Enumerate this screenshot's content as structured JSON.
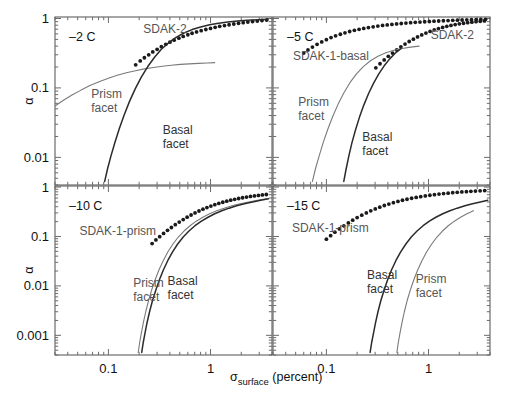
{
  "figure": {
    "width": 510,
    "height": 401,
    "background": "#ffffff",
    "frame_color": "#6b6b6b",
    "dark_curve_color": "#2b2b2b",
    "light_curve_color": "#7a7a7a",
    "dot_color": "#1a1a1a",
    "text_color": "#111111",
    "label_gray": "#555555"
  },
  "axis": {
    "xlabel_sigma": "σ",
    "xlabel_sub": "surface",
    "xlabel_unit": " (percent)",
    "xlabel_full": "σsurface (percent)",
    "ylabel": "α",
    "xscale": "log",
    "yscale": "log",
    "xlim": [
      0.03,
      4.0
    ],
    "x_ticklabels": [
      "0.1",
      "1"
    ],
    "x_tickvalues": [
      0.1,
      1
    ],
    "y_ticklabels_top": [
      "1",
      "0.1",
      "0.01"
    ],
    "y_tickvalues_top": [
      1,
      0.1,
      0.01
    ],
    "y_ticklabels_bottom": [
      "1",
      "0.1",
      "0.01",
      "0.001"
    ],
    "y_tickvalues_bottom": [
      1,
      0.1,
      0.01,
      0.001
    ],
    "ylim_top": [
      0.004,
      1.05
    ],
    "ylim_bottom": [
      0.0004,
      1.05
    ]
  },
  "chart_data": {
    "type": "line",
    "title": "",
    "xlabel": "σsurface (percent)",
    "ylabel": "α",
    "xscale": "log",
    "yscale": "log",
    "grid": false,
    "legend_position": "inline-annotations",
    "panels": [
      {
        "id": "panel-top-left",
        "temperature_label": "–2 C",
        "xlim": [
          0.03,
          4.0
        ],
        "ylim": [
          0.004,
          1.05
        ],
        "ytick_labels": [
          "1",
          "0.1",
          "0.01"
        ],
        "series": [
          {
            "name": "SDAK-2",
            "style": "dots",
            "label": "SDAK-2",
            "label_x": 0.22,
            "label_y": 0.62,
            "x": [
              0.185,
              0.205,
              0.225,
              0.248,
              0.272,
              0.3,
              0.33,
              0.365,
              0.4,
              0.44,
              0.49,
              0.54,
              0.6,
              0.66,
              0.73,
              0.81,
              0.9,
              1.0,
              1.11,
              1.23,
              1.37,
              1.52,
              1.69,
              1.88,
              2.09,
              2.32,
              2.58,
              2.87,
              3.19,
              3.55
            ],
            "y": [
              0.215,
              0.245,
              0.272,
              0.3,
              0.33,
              0.36,
              0.392,
              0.424,
              0.455,
              0.487,
              0.52,
              0.552,
              0.583,
              0.613,
              0.64,
              0.667,
              0.694,
              0.72,
              0.745,
              0.77,
              0.79,
              0.812,
              0.833,
              0.853,
              0.87,
              0.888,
              0.905,
              0.92,
              0.935,
              0.948
            ]
          },
          {
            "name": "Prism facet",
            "style": "line-light",
            "label_line1": "Prism",
            "label_line2": "facet",
            "label_x": 0.068,
            "label_y": 0.072,
            "x": [
              0.03,
              0.036,
              0.044,
              0.054,
              0.066,
              0.081,
              0.1,
              0.122,
              0.15,
              0.184,
              0.225,
              0.276,
              0.338,
              0.414,
              0.507,
              0.62,
              0.76,
              0.93,
              1.1
            ],
            "y": [
              0.055,
              0.066,
              0.079,
              0.093,
              0.108,
              0.123,
              0.138,
              0.152,
              0.165,
              0.177,
              0.188,
              0.197,
              0.205,
              0.212,
              0.218,
              0.222,
              0.226,
              0.229,
              0.231
            ]
          },
          {
            "name": "Basal facet",
            "style": "line-dark",
            "label_line1": "Basal",
            "label_line2": "facet",
            "label_x": 0.34,
            "label_y": 0.022,
            "x": [
              0.092,
              0.098,
              0.106,
              0.116,
              0.128,
              0.143,
              0.161,
              0.183,
              0.21,
              0.243,
              0.283,
              0.33,
              0.39,
              0.46,
              0.55,
              0.66,
              0.8,
              0.98,
              1.2,
              1.48,
              1.84,
              2.3,
              2.9,
              3.65
            ],
            "y": [
              0.0045,
              0.0068,
              0.0105,
              0.0165,
              0.026,
              0.041,
              0.064,
              0.097,
              0.143,
              0.203,
              0.277,
              0.36,
              0.448,
              0.535,
              0.618,
              0.692,
              0.756,
              0.81,
              0.855,
              0.891,
              0.919,
              0.941,
              0.958,
              0.971
            ]
          }
        ]
      },
      {
        "id": "panel-top-right",
        "temperature_label": "–5 C",
        "xlim": [
          0.03,
          4.0
        ],
        "ylim": [
          0.004,
          1.05
        ],
        "series": [
          {
            "name": "SDAK-1-basal",
            "style": "dots",
            "label": "SDAK-1-basal",
            "label_x": 0.047,
            "label_y": 0.255,
            "x": [
              0.06,
              0.066,
              0.073,
              0.081,
              0.09,
              0.1,
              0.111,
              0.123,
              0.137,
              0.152,
              0.169,
              0.188,
              0.209,
              0.232,
              0.258,
              0.287,
              0.319,
              0.355,
              0.394,
              0.438,
              0.487,
              0.541,
              0.601,
              0.668,
              0.742,
              0.825,
              0.917,
              1.019,
              1.132,
              1.258,
              1.398,
              1.554,
              1.727,
              1.919,
              2.133,
              2.37,
              2.634,
              2.927,
              3.253,
              3.615
            ],
            "y": [
              0.318,
              0.352,
              0.388,
              0.424,
              0.46,
              0.495,
              0.53,
              0.562,
              0.593,
              0.622,
              0.649,
              0.674,
              0.698,
              0.72,
              0.74,
              0.759,
              0.777,
              0.793,
              0.808,
              0.822,
              0.835,
              0.847,
              0.858,
              0.869,
              0.879,
              0.888,
              0.897,
              0.905,
              0.913,
              0.92,
              0.927,
              0.933,
              0.939,
              0.945,
              0.95,
              0.955,
              0.96,
              0.964,
              0.968,
              0.972
            ]
          },
          {
            "name": "SDAK-2",
            "style": "dots",
            "label": "SDAK-2",
            "label_x": 1.05,
            "label_y": 0.5,
            "x": [
              0.305,
              0.335,
              0.368,
              0.404,
              0.444,
              0.488,
              0.536,
              0.589,
              0.647,
              0.711,
              0.781,
              0.858,
              0.943,
              1.036,
              1.138,
              1.251,
              1.374,
              1.51,
              1.659,
              1.823,
              2.003,
              2.201,
              2.419,
              2.658,
              2.92,
              3.209,
              3.526
            ],
            "y": [
              0.195,
              0.223,
              0.253,
              0.285,
              0.318,
              0.353,
              0.39,
              0.428,
              0.466,
              0.504,
              0.542,
              0.58,
              0.616,
              0.651,
              0.684,
              0.715,
              0.744,
              0.77,
              0.794,
              0.816,
              0.836,
              0.854,
              0.87,
              0.885,
              0.898,
              0.91,
              0.921
            ]
          },
          {
            "name": "Prism facet",
            "style": "line-light",
            "label_line1": "Prism",
            "label_line2": "facet",
            "label_x": 0.053,
            "label_y": 0.055,
            "x": [
              0.073,
              0.078,
              0.085,
              0.093,
              0.103,
              0.115,
              0.13,
              0.148,
              0.17,
              0.197,
              0.23,
              0.27,
              0.32,
              0.382,
              0.458,
              0.552,
              0.668,
              0.81
            ],
            "y": [
              0.0045,
              0.0068,
              0.0105,
              0.0163,
              0.0252,
              0.0385,
              0.058,
              0.0845,
              0.119,
              0.159,
              0.203,
              0.246,
              0.286,
              0.32,
              0.348,
              0.37,
              0.387,
              0.4
            ]
          },
          {
            "name": "Basal facet",
            "style": "line-dark",
            "label_line1": "Basal",
            "label_line2": "facet",
            "label_x": 0.225,
            "label_y": 0.017,
            "x": [
              0.148,
              0.156,
              0.166,
              0.178,
              0.193,
              0.211,
              0.233,
              0.259,
              0.29,
              0.326,
              0.368,
              0.417,
              0.474,
              0.54
            ],
            "y": [
              0.0045,
              0.0068,
              0.0105,
              0.0163,
              0.025,
              0.038,
              0.057,
              0.083,
              0.117,
              0.159,
              0.208,
              0.262,
              0.318,
              0.372
            ]
          }
        ]
      },
      {
        "id": "panel-bottom-left",
        "temperature_label": "–10 C",
        "xlim": [
          0.03,
          4.0
        ],
        "ylim": [
          0.0004,
          1.05
        ],
        "ytick_labels": [
          "1",
          "0.1",
          "0.01",
          "0.001"
        ],
        "series": [
          {
            "name": "SDAK-1-prism",
            "style": "dots",
            "label": "SDAK-1-prism",
            "label_x": 0.052,
            "label_y": 0.105,
            "x": [
              0.268,
              0.292,
              0.318,
              0.347,
              0.379,
              0.414,
              0.452,
              0.494,
              0.54,
              0.59,
              0.645,
              0.705,
              0.771,
              0.843,
              0.922,
              1.008,
              1.102,
              1.205,
              1.318,
              1.441,
              1.576,
              1.723,
              1.884,
              2.06,
              2.253,
              2.463,
              2.693,
              2.945,
              3.22,
              3.52
            ],
            "y": [
              0.072,
              0.085,
              0.099,
              0.115,
              0.133,
              0.152,
              0.173,
              0.196,
              0.22,
              0.246,
              0.272,
              0.3,
              0.328,
              0.356,
              0.384,
              0.412,
              0.44,
              0.467,
              0.493,
              0.518,
              0.542,
              0.565,
              0.587,
              0.608,
              0.627,
              0.645,
              0.662,
              0.678,
              0.693,
              0.707
            ]
          },
          {
            "name": "Prism facet",
            "style": "line-light",
            "label_line1": "Prism",
            "label_line2": "facet",
            "label_x": 0.175,
            "label_y": 0.0095,
            "x": [
              0.196,
              0.202,
              0.21,
              0.22,
              0.232,
              0.247,
              0.265,
              0.287,
              0.313,
              0.345,
              0.383,
              0.429,
              0.484,
              0.55,
              0.63,
              0.725,
              0.84,
              0.98,
              1.15,
              1.36,
              1.62,
              1.95,
              2.36,
              2.88,
              3.55
            ],
            "y": [
              0.00045,
              0.0007,
              0.0011,
              0.0018,
              0.003,
              0.005,
              0.0082,
              0.0133,
              0.0212,
              0.0327,
              0.049,
              0.0705,
              0.0975,
              0.129,
              0.165,
              0.204,
              0.245,
              0.288,
              0.331,
              0.374,
              0.417,
              0.459,
              0.5,
              0.54,
              0.578
            ]
          },
          {
            "name": "Basal facet",
            "style": "line-dark",
            "label_line1": "Basal",
            "label_line2": "facet",
            "label_x": 0.38,
            "label_y": 0.0105,
            "x": [
              0.212,
              0.219,
              0.228,
              0.239,
              0.253,
              0.27,
              0.291,
              0.316,
              0.346,
              0.382,
              0.425,
              0.477,
              0.54,
              0.615,
              0.705,
              0.815,
              0.945,
              1.1,
              1.29,
              1.52,
              1.8,
              2.15,
              2.58,
              3.1,
              3.7
            ],
            "y": [
              0.00045,
              0.0007,
              0.0011,
              0.0018,
              0.003,
              0.005,
              0.0082,
              0.0133,
              0.0212,
              0.0327,
              0.049,
              0.0705,
              0.0975,
              0.129,
              0.165,
              0.204,
              0.245,
              0.288,
              0.331,
              0.374,
              0.417,
              0.459,
              0.5,
              0.54,
              0.578
            ]
          }
        ]
      },
      {
        "id": "panel-bottom-right",
        "temperature_label": "–15 C",
        "xlim": [
          0.03,
          4.0
        ],
        "ylim": [
          0.0004,
          1.05
        ],
        "series": [
          {
            "name": "SDAK-1-prism",
            "style": "dots",
            "label": "SDAK-1-prism",
            "label_x": 0.046,
            "label_y": 0.125,
            "x": [
              0.1,
              0.11,
              0.121,
              0.134,
              0.148,
              0.164,
              0.181,
              0.2,
              0.222,
              0.246,
              0.272,
              0.301,
              0.333,
              0.369,
              0.409,
              0.453,
              0.502,
              0.556,
              0.616,
              0.683,
              0.757,
              0.839,
              0.93,
              1.031,
              1.143,
              1.267,
              1.404,
              1.556,
              1.725,
              1.912,
              2.12,
              2.35,
              2.6,
              2.88,
              3.2,
              3.55
            ],
            "y": [
              0.088,
              0.104,
              0.122,
              0.142,
              0.164,
              0.188,
              0.214,
              0.241,
              0.27,
              0.3,
              0.33,
              0.361,
              0.392,
              0.423,
              0.453,
              0.483,
              0.512,
              0.54,
              0.567,
              0.593,
              0.617,
              0.64,
              0.662,
              0.683,
              0.702,
              0.72,
              0.737,
              0.753,
              0.768,
              0.782,
              0.795,
              0.807,
              0.818,
              0.829,
              0.839,
              0.848
            ]
          },
          {
            "name": "Basal facet",
            "style": "line-dark",
            "label_line1": "Basal",
            "label_line2": "facet",
            "label_x": 0.25,
            "label_y": 0.0135,
            "x": [
              0.268,
              0.277,
              0.289,
              0.303,
              0.32,
              0.341,
              0.367,
              0.398,
              0.435,
              0.48,
              0.534,
              0.6,
              0.678,
              0.772,
              0.885,
              1.02,
              1.18,
              1.38,
              1.62,
              1.91,
              2.27,
              2.7,
              3.22,
              3.8
            ],
            "y": [
              0.00045,
              0.0007,
              0.0011,
              0.0018,
              0.003,
              0.005,
              0.0082,
              0.0133,
              0.0212,
              0.0327,
              0.049,
              0.0705,
              0.0975,
              0.129,
              0.165,
              0.204,
              0.245,
              0.288,
              0.331,
              0.374,
              0.417,
              0.459,
              0.5,
              0.54
            ]
          },
          {
            "name": "Prism facet",
            "style": "line-light",
            "label_line1": "Prism",
            "label_line2": "facet",
            "label_x": 0.75,
            "label_y": 0.0115,
            "x": [
              0.49,
              0.505,
              0.525,
              0.55,
              0.58,
              0.617,
              0.663,
              0.718,
              0.785,
              0.865,
              0.96,
              1.075,
              1.21,
              1.37,
              1.56,
              1.79,
              2.06,
              2.38,
              2.76
            ],
            "y": [
              0.00045,
              0.0007,
              0.0011,
              0.0018,
              0.003,
              0.005,
              0.0082,
              0.0133,
              0.0212,
              0.0327,
              0.049,
              0.0705,
              0.0975,
              0.129,
              0.165,
              0.204,
              0.245,
              0.288,
              0.331
            ]
          }
        ]
      }
    ]
  }
}
